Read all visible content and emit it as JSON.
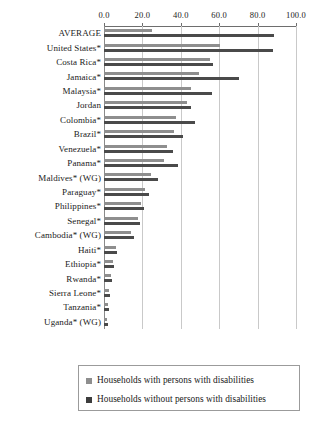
{
  "chart_data": {
    "type": "bar",
    "orientation": "horizontal",
    "title": "",
    "xlabel": "",
    "ylabel": "",
    "xlim": [
      0.0,
      100.0
    ],
    "xticks": [
      "0.0",
      "20.0",
      "40.0",
      "60.0",
      "80.0",
      "100.0"
    ],
    "xtick_values": [
      0,
      20,
      40,
      60,
      80,
      100
    ],
    "grid": true,
    "axis_position": "top",
    "legend_position": "bottom",
    "categories": [
      "AVERAGE",
      "United States*",
      "Costa Rica*",
      "Jamaica*",
      "Malaysia*",
      "Jordan",
      "Colombia*",
      "Brazil*",
      "Venezuela*",
      "Panama*",
      "Maldives* (WG)",
      "Paraguay*",
      "Philippines*",
      "Senegal*",
      "Cambodia* (WG)",
      "Haiti*",
      "Ethiopia*",
      "Rwanda*",
      "Sierra Leone*",
      "Tanzania*",
      "Uganda* (WG)"
    ],
    "series": [
      {
        "name": "Households with persons with disabilities",
        "color": "#8e8e8e",
        "values": [
          25.0,
          60.5,
          55.0,
          49.5,
          45.5,
          43.0,
          37.5,
          36.5,
          33.0,
          31.5,
          24.5,
          21.5,
          19.5,
          17.5,
          14.0,
          6.0,
          4.5,
          3.5,
          2.5,
          2.0,
          1.5
        ]
      },
      {
        "name": "Households without persons with disabilities",
        "color": "#4a4a4a",
        "values": [
          88.5,
          88.0,
          57.0,
          70.5,
          56.5,
          45.5,
          47.5,
          41.0,
          36.0,
          38.5,
          28.0,
          23.5,
          21.0,
          19.0,
          15.5,
          7.0,
          5.0,
          4.0,
          3.0,
          2.5,
          2.0
        ]
      }
    ]
  },
  "legend": {
    "items": [
      {
        "label": "Households with persons with disabilities",
        "color": "#8e8e8e"
      },
      {
        "label": "Households without persons with disabilities",
        "color": "#3d3d3d"
      }
    ]
  }
}
